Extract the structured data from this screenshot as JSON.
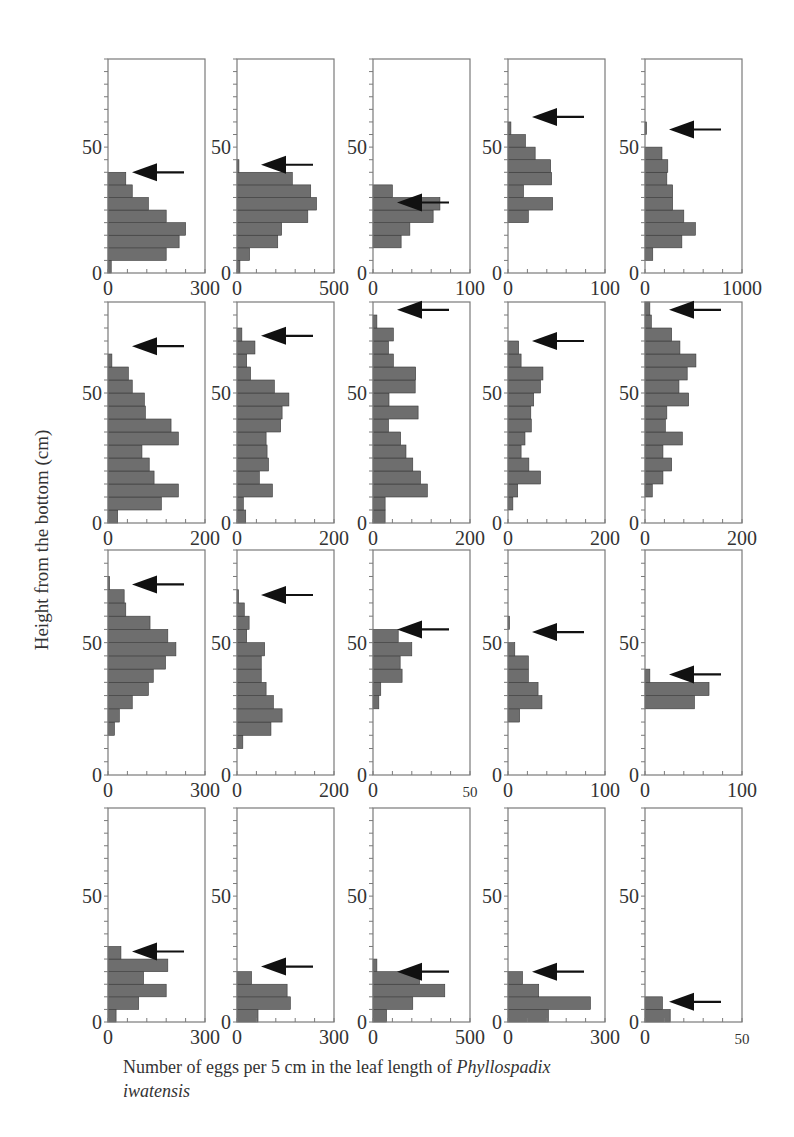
{
  "figure": {
    "ylabel": "Height from the bottom (cm)",
    "caption_prefix": "Number of eggs per 5 cm in the leaf length of ",
    "caption_species": "Phyllospadix",
    "caption_species_2": "iwatensis"
  },
  "chart_data": {
    "type": "bar",
    "orientation": "horizontal",
    "grid": "4x5 small multiples",
    "ylabel": "Height from the bottom (cm)",
    "xlabel": "Number of eggs per 5 cm in the leaf length of Phyllospadix iwatensis",
    "bin_width_cm": 5,
    "ylim": [
      0,
      85
    ],
    "yticks_labeled": [
      0,
      50
    ],
    "grid_lines": false,
    "legend": null,
    "annotation": "Arrow marks leaf height (top of leaf) in each panel",
    "panels": [
      {
        "row": 0,
        "col": 0,
        "xmax": 300,
        "xtick_labels": [
          "0",
          "300"
        ],
        "arrow_cm": 40,
        "bins_from_0cm": [
          10,
          180,
          220,
          240,
          180,
          125,
          75,
          55
        ]
      },
      {
        "row": 0,
        "col": 1,
        "xmax": 500,
        "xtick_labels": [
          "0",
          "500"
        ],
        "arrow_cm": 43,
        "bins_from_0cm": [
          15,
          65,
          210,
          230,
          365,
          410,
          380,
          285,
          10
        ]
      },
      {
        "row": 0,
        "col": 2,
        "xmax": 100,
        "xtick_labels": [
          "0",
          "100"
        ],
        "arrow_cm": 28,
        "bins_from_0cm": [
          0,
          0,
          29,
          38,
          62,
          69,
          20
        ]
      },
      {
        "row": 0,
        "col": 3,
        "xmax": 100,
        "xtick_labels": [
          "0",
          "100"
        ],
        "arrow_cm": 62,
        "bins_from_0cm": [
          0,
          0,
          0,
          0,
          21,
          46,
          16,
          45,
          44,
          28,
          18,
          3
        ]
      },
      {
        "row": 0,
        "col": 4,
        "xmax": 1000,
        "xtick_labels": [
          "0",
          "1000"
        ],
        "arrow_cm": 57,
        "bins_from_0cm": [
          0,
          80,
          380,
          520,
          400,
          285,
          285,
          225,
          235,
          175,
          0,
          5
        ]
      },
      {
        "row": 1,
        "col": 0,
        "xmax": 200,
        "xtick_labels": [
          "0",
          "200"
        ],
        "arrow_cm": 68,
        "bins_from_0cm": [
          20,
          110,
          145,
          95,
          85,
          70,
          145,
          130,
          77,
          75,
          50,
          42,
          8
        ]
      },
      {
        "row": 1,
        "col": 1,
        "xmax": 200,
        "xtick_labels": [
          "0",
          "200"
        ],
        "arrow_cm": 72,
        "bins_from_0cm": [
          18,
          13,
          73,
          46,
          65,
          62,
          60,
          90,
          93,
          107,
          77,
          28,
          20,
          37,
          10
        ]
      },
      {
        "row": 1,
        "col": 2,
        "xmax": 200,
        "xtick_labels": [
          "0",
          "200"
        ],
        "arrow_cm": 82,
        "bins_from_0cm": [
          25,
          25,
          112,
          98,
          82,
          68,
          57,
          32,
          93,
          33,
          87,
          88,
          42,
          32,
          42,
          8
        ]
      },
      {
        "row": 1,
        "col": 3,
        "xmax": 200,
        "xtick_labels": [
          "0",
          "200"
        ],
        "arrow_cm": 70,
        "bins_from_0cm": [
          0,
          10,
          20,
          67,
          43,
          27,
          35,
          48,
          47,
          53,
          67,
          72,
          27,
          22
        ]
      },
      {
        "row": 1,
        "col": 4,
        "xmax": 200,
        "xtick_labels": [
          "0",
          "200"
        ],
        "arrow_cm": 82,
        "bins_from_0cm": [
          0,
          0,
          15,
          37,
          55,
          37,
          77,
          42,
          45,
          90,
          70,
          87,
          105,
          72,
          55,
          13,
          10
        ]
      },
      {
        "row": 2,
        "col": 0,
        "xmax": 300,
        "xtick_labels": [
          "0",
          "300"
        ],
        "arrow_cm": 72,
        "bins_from_0cm": [
          0,
          0,
          0,
          20,
          35,
          75,
          125,
          140,
          178,
          210,
          185,
          130,
          55,
          50,
          5
        ]
      },
      {
        "row": 2,
        "col": 1,
        "xmax": 200,
        "xtick_labels": [
          "0",
          "200"
        ],
        "arrow_cm": 68,
        "bins_from_0cm": [
          0,
          0,
          12,
          70,
          93,
          75,
          60,
          50,
          50,
          57,
          20,
          25,
          15,
          3
        ]
      },
      {
        "row": 2,
        "col": 2,
        "xmax": 50,
        "xtick_labels": [
          "0",
          "50"
        ],
        "arrow_cm": 55,
        "bins_from_0cm": [
          0,
          0,
          0,
          0,
          0,
          3,
          4,
          15,
          14,
          20,
          13
        ]
      },
      {
        "row": 2,
        "col": 3,
        "xmax": 100,
        "xtick_labels": [
          "0",
          "100"
        ],
        "arrow_cm": 54,
        "bins_from_0cm": [
          0,
          0,
          0,
          0,
          12,
          35,
          31,
          21,
          21,
          7,
          0,
          1
        ]
      },
      {
        "row": 2,
        "col": 4,
        "xmax": 100,
        "xtick_labels": [
          "0",
          "100"
        ],
        "arrow_cm": 38,
        "bins_from_0cm": [
          0,
          0,
          0,
          0,
          0,
          51,
          66,
          5
        ]
      },
      {
        "row": 3,
        "col": 0,
        "xmax": 300,
        "xtick_labels": [
          "0",
          "300"
        ],
        "arrow_cm": 28,
        "bins_from_0cm": [
          25,
          95,
          180,
          110,
          185,
          40
        ]
      },
      {
        "row": 3,
        "col": 1,
        "xmax": 300,
        "xtick_labels": [
          "0",
          "300"
        ],
        "arrow_cm": 22,
        "bins_from_0cm": [
          65,
          165,
          155,
          45
        ]
      },
      {
        "row": 3,
        "col": 2,
        "xmax": 500,
        "xtick_labels": [
          "0",
          "500"
        ],
        "arrow_cm": 20,
        "bins_from_0cm": [
          70,
          205,
          370,
          240,
          20
        ]
      },
      {
        "row": 3,
        "col": 3,
        "xmax": 300,
        "xtick_labels": [
          "0",
          "300"
        ],
        "arrow_cm": 20,
        "bins_from_0cm": [
          125,
          255,
          95,
          45
        ]
      },
      {
        "row": 3,
        "col": 4,
        "xmax": 50,
        "xtick_labels": [
          "0",
          "50"
        ],
        "arrow_cm": 8,
        "bins_from_0cm": [
          13,
          9
        ]
      }
    ]
  },
  "layout": {
    "col_x": [
      108,
      237,
      373,
      508,
      645
    ],
    "row_top": [
      59,
      302,
      550,
      808
    ],
    "row_bottom": [
      273,
      523,
      775,
      1022
    ],
    "panel_width": 97,
    "bar_color": "#6e6e6e",
    "frame_color": "#7a7a7a"
  }
}
